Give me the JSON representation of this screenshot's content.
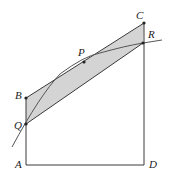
{
  "diagram": {
    "colors": {
      "shade": "#d4d4d4",
      "line": "#3a3a3a",
      "curve": "#555555"
    },
    "points": {
      "A": {
        "label": "A",
        "x": 26,
        "y": 165
      },
      "B": {
        "label": "B",
        "x": 26,
        "y": 98
      },
      "C": {
        "label": "C",
        "x": 144,
        "y": 23
      },
      "D": {
        "label": "D",
        "x": 144,
        "y": 165
      },
      "P": {
        "label": "P",
        "x": 84,
        "y": 62
      },
      "Q": {
        "label": "Q",
        "x": 26,
        "y": 124
      },
      "R": {
        "label": "R",
        "x": 143,
        "y": 43
      }
    }
  }
}
